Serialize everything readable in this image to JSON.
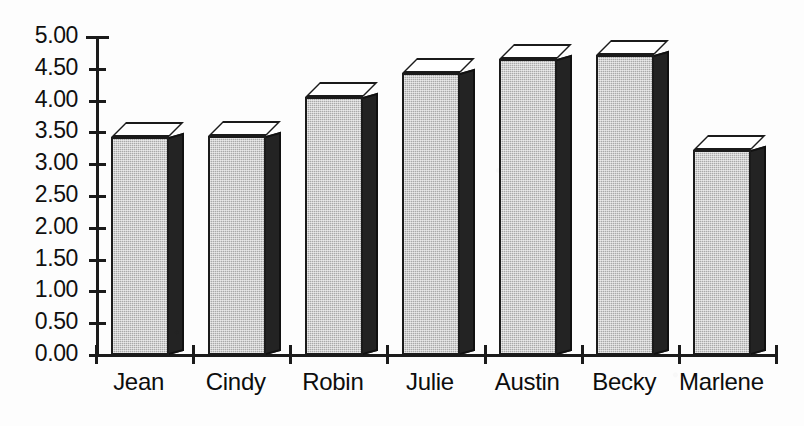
{
  "chart_data": {
    "type": "bar",
    "title": "",
    "subtitle": "",
    "xlabel": "",
    "ylabel": "",
    "categories": [
      "Jean",
      "Cindy",
      "Robin",
      "Julie",
      "Austin",
      "Becky",
      "Marlene"
    ],
    "values": [
      3.43,
      3.44,
      4.06,
      4.43,
      4.65,
      4.72,
      3.22
    ],
    "series": [
      {
        "name": "",
        "values": [
          3.43,
          3.44,
          4.06,
          4.43,
          4.65,
          4.72,
          3.22
        ]
      }
    ],
    "ylim": [
      0.0,
      5.0
    ],
    "ytick_values": [
      0.0,
      0.5,
      1.0,
      1.5,
      2.0,
      2.5,
      3.0,
      3.5,
      4.0,
      4.5,
      5.0
    ],
    "ytick_labels": [
      "0.00",
      "0.50",
      "1.00",
      "1.50",
      "2.00",
      "2.50",
      "3.00",
      "3.50",
      "4.00",
      "4.50",
      "5.00"
    ],
    "grid": false,
    "legend": null,
    "legend_position": "none",
    "annotations": [],
    "style": {
      "bar_face_color": "#a9a9a9",
      "bar_side_color": "#232323",
      "bar_top_color": "#ffffff",
      "bar_outline_color": "#1b1b1b",
      "axis_color": "#1b1b1b",
      "background_color": "#fdfdfd",
      "text_color": "#101010",
      "three_d": true
    }
  }
}
